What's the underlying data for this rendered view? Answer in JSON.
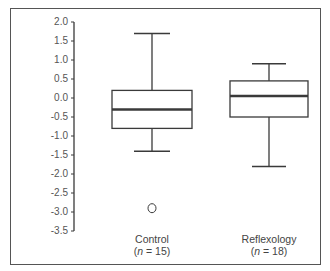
{
  "chart_data": {
    "type": "box",
    "title": "",
    "xlabel": "",
    "ylabel": "Change in constipation/diarrhoea",
    "ylim": [
      -3.5,
      2.0
    ],
    "yticks": [
      "2.0",
      "1.5",
      "1.0",
      "0.5",
      "0.0",
      "-0.5",
      "-1.0",
      "-1.5",
      "-2.0",
      "-2.5",
      "-3.0",
      "-3.5"
    ],
    "grid": false,
    "legend": null,
    "categories": [
      "Control",
      "Reflexology"
    ],
    "series": [
      {
        "name": "Control",
        "n_label": "(n = 15)",
        "n": 15,
        "whisker_high": 1.7,
        "q3": 0.2,
        "median": -0.3,
        "q1": -0.8,
        "whisker_low": -1.4,
        "outliers": [
          -2.9
        ]
      },
      {
        "name": "Reflexology",
        "n_label": "(n = 18)",
        "n": 18,
        "whisker_high": 0.9,
        "q3": 0.45,
        "median": 0.05,
        "q1": -0.5,
        "whisker_low": -1.8,
        "outliers": []
      }
    ]
  },
  "labels": {
    "ylabel": "Change in constipation/diarrhoea",
    "control_name": "Control",
    "control_n_prefix": "(",
    "control_n_var": "n",
    "control_n_rest": " = 15)",
    "reflex_name": "Reflexology",
    "reflex_n_prefix": "(",
    "reflex_n_var": "n",
    "reflex_n_rest": " = 18)"
  },
  "colors": {
    "line": "#3a3a3a",
    "frame": "#555555",
    "text": "#444444"
  }
}
